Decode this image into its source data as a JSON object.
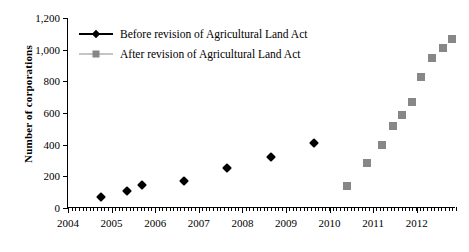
{
  "chart_data": {
    "type": "scatter",
    "title": "",
    "xlabel": "",
    "ylabel": "Number of corporations",
    "xlim": [
      2004.0,
      2012.9
    ],
    "ylim": [
      0,
      1200
    ],
    "grid": false,
    "legend_position": "top-left",
    "x_ticks": [
      "2004",
      "2005",
      "2006",
      "2007",
      "2008",
      "2009",
      "2010",
      "2011",
      "2012"
    ],
    "x_tick_values": [
      2004,
      2005,
      2006,
      2007,
      2008,
      2009,
      2010,
      2011,
      2012
    ],
    "x_minor_tick_count": 107,
    "y_ticks": [
      "0",
      "200",
      "400",
      "600",
      "800",
      "1,000",
      "1,200"
    ],
    "y_tick_values": [
      0,
      200,
      400,
      600,
      800,
      1000,
      1200
    ],
    "series": [
      {
        "name": "Before revision of Agricultural Land Act",
        "marker": "diamond",
        "color": "#000000",
        "x": [
          2004.75,
          2005.35,
          2005.7,
          2006.65,
          2007.65,
          2008.65,
          2009.65
        ],
        "values": [
          70,
          105,
          145,
          170,
          255,
          320,
          410
        ]
      },
      {
        "name": "After revision of Agricultural Land Act",
        "marker": "square",
        "color": "#878787",
        "x": [
          2010.4,
          2010.85,
          2011.2,
          2011.45,
          2011.65,
          2011.9,
          2012.1,
          2012.35,
          2012.6,
          2012.8
        ],
        "values": [
          140,
          285,
          400,
          520,
          590,
          670,
          830,
          945,
          1010,
          1070
        ]
      }
    ]
  },
  "legend": {
    "items": [
      {
        "label": "Before revision of Agricultural Land Act",
        "marker": "diamond",
        "color": "#000000"
      },
      {
        "label": "After revision of Agricultural Land Act",
        "marker": "square",
        "color": "#878787"
      }
    ]
  },
  "axis": {
    "y_title": "Number of corporations"
  }
}
